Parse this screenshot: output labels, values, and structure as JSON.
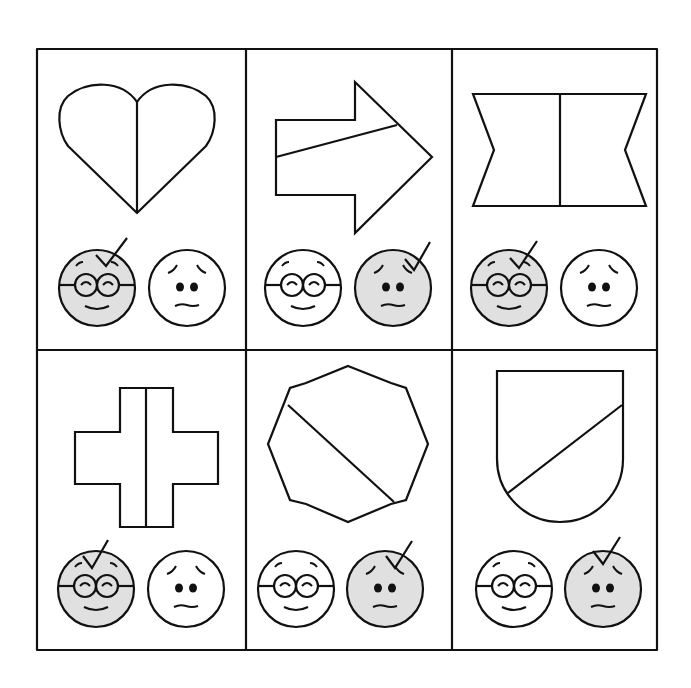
{
  "colors": {
    "line": "#111111",
    "highlight": "#e0e0e0",
    "background": "#ffffff"
  },
  "grid": {
    "rows": 2,
    "cols": 3
  },
  "cells": [
    {
      "shape": "heart",
      "shape_label": "heart split vertically",
      "selected": "happy"
    },
    {
      "shape": "arrow",
      "shape_label": "arrow split diagonally",
      "selected": "sad"
    },
    {
      "shape": "bowtie",
      "shape_label": "notched rectangle split vertically",
      "selected": "happy"
    },
    {
      "shape": "cross",
      "shape_label": "cross split vertically",
      "selected": "happy"
    },
    {
      "shape": "octagon",
      "shape_label": "octagon split diagonally",
      "selected": "sad"
    },
    {
      "shape": "shield",
      "shape_label": "shield split diagonally",
      "selected": "sad"
    }
  ],
  "faces": {
    "happy": "happy-face-with-glasses",
    "sad": "worried-face"
  }
}
